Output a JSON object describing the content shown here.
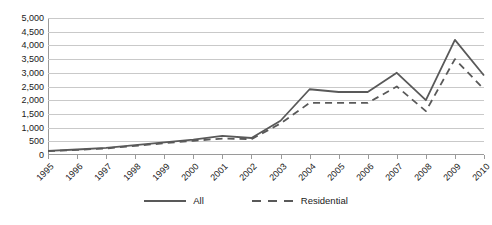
{
  "chart_data": {
    "type": "line",
    "title": "",
    "subtitle": "",
    "xlabel": "",
    "ylabel": "",
    "categories": [
      "1995",
      "1996",
      "1997",
      "1998",
      "1999",
      "2000",
      "2001",
      "2002",
      "2003",
      "2004",
      "2005",
      "2006",
      "2007",
      "2008",
      "2009",
      "2010"
    ],
    "series": [
      {
        "name": "All",
        "style": "solid",
        "color": "#595959",
        "values": [
          150,
          200,
          260,
          360,
          460,
          560,
          700,
          620,
          1250,
          2400,
          2300,
          2300,
          3000,
          2000,
          4200,
          2900
        ]
      },
      {
        "name": "Residential",
        "style": "dashed",
        "color": "#595959",
        "values": [
          140,
          185,
          240,
          335,
          430,
          520,
          600,
          580,
          1150,
          1900,
          1900,
          1900,
          2500,
          1600,
          3500,
          2400
        ]
      }
    ],
    "ylim": [
      0,
      5000
    ],
    "ytick_step": 500,
    "ytick_labels": [
      "0",
      "500",
      "1,000",
      "1,500",
      "2,000",
      "2,500",
      "3,000",
      "3,500",
      "4,000",
      "4,500",
      "5,000"
    ],
    "grid": "horizontal",
    "legend_position": "bottom-center",
    "axis_color": "#9a9a9a",
    "grid_color": "#c9c9c9",
    "background": "#ffffff"
  }
}
